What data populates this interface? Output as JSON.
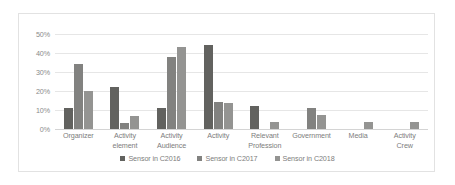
{
  "chart_data": {
    "type": "bar",
    "title": "",
    "subtitle": "",
    "xlabel": "",
    "ylabel": "",
    "ylim": [
      0,
      50
    ],
    "ytick_labels": [
      "0%",
      "10%",
      "20%",
      "30%",
      "40%",
      "50%"
    ],
    "ytick_values": [
      0,
      10,
      20,
      30,
      40,
      50
    ],
    "grid": true,
    "legend_position": "bottom",
    "categories": [
      "Organizer",
      "Activity element",
      "Activity Audience",
      "Activity",
      "Relevant Profession",
      "Government",
      "Media",
      "Activity Crew"
    ],
    "series": [
      {
        "name": "Sensor in C2016",
        "color": "#62625f",
        "values": [
          11,
          22,
          11,
          44,
          12,
          0,
          0,
          0
        ]
      },
      {
        "name": "Sensor in C2017",
        "color": "#828280",
        "values": [
          34,
          3,
          38,
          14,
          0,
          11,
          0,
          0
        ]
      },
      {
        "name": "Sensor in C2018",
        "color": "#949492",
        "values": [
          20,
          7,
          43,
          13.5,
          3.5,
          7.5,
          3.5,
          3.5
        ]
      }
    ]
  }
}
